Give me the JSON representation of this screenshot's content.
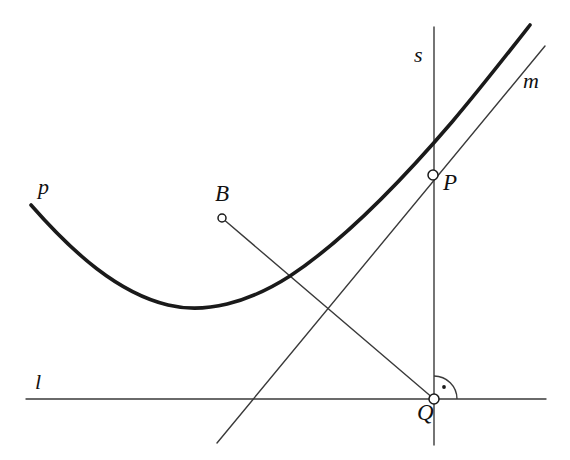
{
  "figure": {
    "kind": "geometry-diagram",
    "background_color": "#ffffff",
    "width": 570,
    "height": 460,
    "stroke_color": "#1a1a1a",
    "thin_stroke_color": "#3a3a3a"
  },
  "labels": {
    "parabola": "p",
    "directrix": "l",
    "vertical_line": "s",
    "tangent": "m",
    "point_p": "P",
    "point_q": "Q",
    "point_b": "B"
  },
  "label_positions": {
    "parabola": {
      "x": 38,
      "y": 176
    },
    "directrix": {
      "x": 35,
      "y": 371
    },
    "vertical_line": {
      "x": 414,
      "y": 44
    },
    "tangent": {
      "x": 523,
      "y": 70
    },
    "point_p": {
      "x": 443,
      "y": 171
    },
    "point_q": {
      "x": 417,
      "y": 401
    },
    "point_b": {
      "x": 215,
      "y": 182
    }
  },
  "chart_data": {
    "type": "scatter",
    "title": "",
    "xlabel": "",
    "ylabel": "",
    "points": [
      {
        "name": "P",
        "x": 433,
        "y": 175,
        "marker": "open-circle",
        "radius": 5
      },
      {
        "name": "Q",
        "x": 434,
        "y": 399,
        "marker": "open-circle",
        "radius": 5
      },
      {
        "name": "B",
        "x": 222,
        "y": 218,
        "marker": "open-circle",
        "radius": 4
      }
    ],
    "curves": [
      {
        "name": "p",
        "type": "parabola",
        "stroke_width": 3.6,
        "path": "M 31,205 C 73,253 118,293 168,305 C 205,314 248,303 290,276 C 340,243 398,185 452,122 C 480,89 512,48 530,25"
      }
    ],
    "lines": [
      {
        "name": "l",
        "x1": 26,
        "y1": 399,
        "x2": 546,
        "y2": 399,
        "stroke_width": 1.4
      },
      {
        "name": "s",
        "x1": 434,
        "y1": 27,
        "x2": 434,
        "y2": 445,
        "stroke_width": 1.4
      },
      {
        "name": "m",
        "x1": 217,
        "y1": 443,
        "x2": 545,
        "y2": 46,
        "stroke_width": 1.4
      },
      {
        "name": "BQ",
        "x1": 222,
        "y1": 218,
        "x2": 434,
        "y2": 399,
        "stroke_width": 1.4
      }
    ],
    "angle_marks": [
      {
        "name": "right-angle-at-Q",
        "vertex_x": 434,
        "vertex_y": 399,
        "radius": 23,
        "from_deg": 270,
        "to_deg": 360,
        "dot_x": 444,
        "dot_y": 387
      }
    ]
  }
}
